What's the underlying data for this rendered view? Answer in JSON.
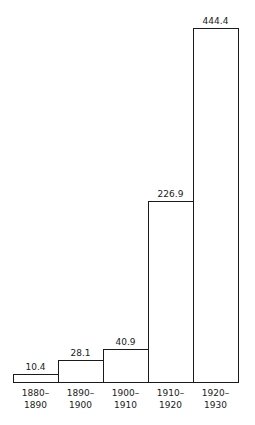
{
  "chart_data": {
    "type": "bar",
    "title": "",
    "xlabel": "",
    "ylabel": "",
    "categories": [
      "1880–\n1890",
      "1890–\n1900",
      "1900–\n1910",
      "1910–\n1920",
      "1920–\n1930"
    ],
    "values": [
      10.4,
      28.1,
      40.9,
      226.9,
      444.4
    ],
    "value_labels": [
      "10.4",
      "28.1",
      "40.9",
      "226.9",
      "444.4"
    ],
    "ylim": [
      0,
      444.4
    ],
    "grid": false,
    "legend": null,
    "bar_style": {
      "fill": "#ffffff",
      "stroke": "#1a1a1a",
      "adjacent": true
    },
    "layout": {
      "baseline_y": 382,
      "max_bar_px": 354,
      "first_bar_left": 13,
      "bar_width": 45
    }
  }
}
